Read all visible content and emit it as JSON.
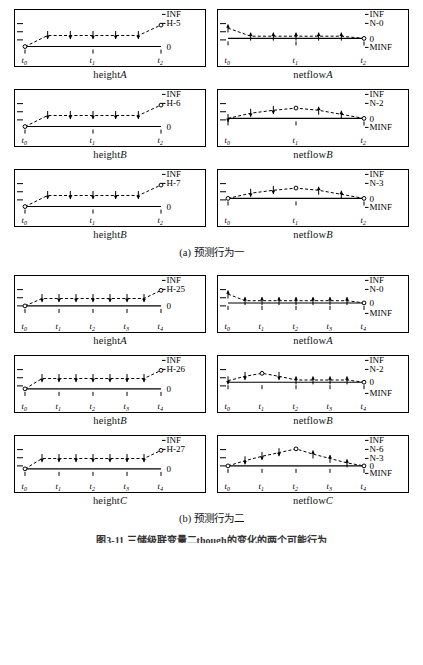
{
  "figure": {
    "caption_a": "(a) 预测行为一",
    "caption_b": "(b) 预测行为二",
    "caption_main": "图3-11  三储级联变量二though的变化的两个可能行为",
    "axis_labels": {
      "inf": "INF",
      "zero": "0",
      "minf": "MINF"
    }
  },
  "chart_data": {
    "type": "line",
    "panels": [
      {
        "id": "a-height-A",
        "caption": "heightA",
        "variable": "height",
        "object": "A",
        "group": "a",
        "value_labels": [
          "INF",
          "H-5",
          "0"
        ],
        "tick_labels": [
          "t0",
          "t1",
          "t2"
        ],
        "x": [
          0,
          1,
          2,
          3,
          4,
          5,
          6
        ],
        "y": [
          0.12,
          0.42,
          0.42,
          0.42,
          0.42,
          0.42,
          0.7
        ],
        "markers": [
          "circle",
          "up",
          "up",
          "up",
          "up",
          "up",
          "circle"
        ],
        "baseline": 0.12
      },
      {
        "id": "a-netflow-A",
        "caption": "netflowA",
        "variable": "netflow",
        "object": "A",
        "group": "a",
        "value_labels": [
          "INF",
          "N-0",
          "0",
          "MINF"
        ],
        "tick_labels": [
          "t0",
          "t1",
          "t2"
        ],
        "x": [
          0,
          1,
          2,
          3,
          4,
          5,
          6
        ],
        "y": [
          0.62,
          0.4,
          0.4,
          0.4,
          0.4,
          0.4,
          0.34
        ],
        "markers": [
          "down",
          "down",
          "down",
          "down",
          "down",
          "down",
          "circle"
        ],
        "baseline": 0.34
      },
      {
        "id": "a-height-B",
        "caption": "heightB",
        "variable": "height",
        "object": "B",
        "group": "a",
        "value_labels": [
          "INF",
          "H-6",
          "0"
        ],
        "tick_labels": [
          "t0",
          "t1",
          "t2"
        ],
        "x": [
          0,
          1,
          2,
          3,
          4,
          5,
          6
        ],
        "y": [
          0.12,
          0.42,
          0.42,
          0.42,
          0.42,
          0.42,
          0.7
        ],
        "markers": [
          "circle",
          "up",
          "up",
          "up",
          "up",
          "up",
          "circle"
        ],
        "baseline": 0.12
      },
      {
        "id": "a-netflow-B",
        "caption": "netflowB",
        "variable": "netflow",
        "object": "B",
        "group": "a",
        "value_labels": [
          "INF",
          "N-2",
          "0",
          "MINF"
        ],
        "tick_labels": [
          "t0",
          "t1",
          "t2"
        ],
        "x": [
          0,
          1,
          2,
          3,
          4,
          5,
          6
        ],
        "y": [
          0.34,
          0.48,
          0.56,
          0.62,
          0.56,
          0.45,
          0.34
        ],
        "markers": [
          "up",
          "up",
          "up",
          "circle",
          "down",
          "down",
          "circle"
        ],
        "baseline": 0.34
      },
      {
        "id": "a-height-B2",
        "caption": "heightB",
        "variable": "height",
        "object": "B",
        "group": "a",
        "value_labels": [
          "INF",
          "H-7",
          "0"
        ],
        "tick_labels": [
          "t0",
          "t1",
          "t2"
        ],
        "x": [
          0,
          1,
          2,
          3,
          4,
          5,
          6
        ],
        "y": [
          0.12,
          0.42,
          0.42,
          0.42,
          0.42,
          0.42,
          0.7
        ],
        "markers": [
          "circle",
          "up",
          "up",
          "up",
          "up",
          "up",
          "circle"
        ],
        "baseline": 0.12
      },
      {
        "id": "a-netflow-B2",
        "caption": "netflowB",
        "variable": "netflow",
        "object": "B",
        "group": "a",
        "value_labels": [
          "INF",
          "N-3",
          "0",
          "MINF"
        ],
        "tick_labels": [
          "t0",
          "t1",
          "t2"
        ],
        "x": [
          0,
          1,
          2,
          3,
          4,
          5,
          6
        ],
        "y": [
          0.34,
          0.48,
          0.56,
          0.62,
          0.56,
          0.45,
          0.34
        ],
        "markers": [
          "circle",
          "up",
          "up",
          "circle",
          "down",
          "down",
          "circle"
        ],
        "baseline": 0.34
      },
      {
        "id": "b-height-A",
        "caption": "heightA",
        "variable": "height",
        "object": "A",
        "group": "b",
        "value_labels": [
          "INF",
          "H-25",
          "0"
        ],
        "tick_labels": [
          "t0",
          "t1",
          "t2",
          "t3",
          "t4"
        ],
        "x": [
          0,
          1,
          2,
          3,
          4,
          5,
          6,
          7,
          8
        ],
        "y": [
          0.3,
          0.5,
          0.5,
          0.5,
          0.5,
          0.5,
          0.5,
          0.5,
          0.72
        ],
        "markers": [
          "circle",
          "up",
          "up",
          "up",
          "up",
          "up",
          "up",
          "up",
          "circle"
        ],
        "baseline": 0.3
      },
      {
        "id": "b-netflow-A",
        "caption": "netflowA",
        "variable": "netflow",
        "object": "A",
        "group": "b",
        "value_labels": [
          "INF",
          "N-0",
          "0",
          "MINF"
        ],
        "tick_labels": [
          "t0",
          "t1",
          "t2",
          "t3",
          "t4"
        ],
        "x": [
          0,
          1,
          2,
          3,
          4,
          5,
          6,
          7,
          8
        ],
        "y": [
          0.62,
          0.44,
          0.44,
          0.44,
          0.44,
          0.44,
          0.44,
          0.44,
          0.38
        ],
        "markers": [
          "down",
          "down",
          "down",
          "down",
          "down",
          "down",
          "down",
          "down",
          "circle"
        ],
        "baseline": 0.38
      },
      {
        "id": "b-height-B",
        "caption": "heightB",
        "variable": "height",
        "object": "B",
        "group": "b",
        "value_labels": [
          "INF",
          "H-26",
          "0"
        ],
        "tick_labels": [
          "t0",
          "t1",
          "t2",
          "t3",
          "t4"
        ],
        "x": [
          0,
          1,
          2,
          3,
          4,
          5,
          6,
          7,
          8
        ],
        "y": [
          0.22,
          0.5,
          0.5,
          0.5,
          0.5,
          0.5,
          0.5,
          0.5,
          0.72
        ],
        "markers": [
          "circle",
          "up",
          "up",
          "up",
          "up",
          "up",
          "up",
          "up",
          "circle"
        ],
        "baseline": 0.22
      },
      {
        "id": "b-netflow-B",
        "caption": "netflowB",
        "variable": "netflow",
        "object": "B",
        "group": "b",
        "value_labels": [
          "INF",
          "N-2",
          "0",
          "MINF"
        ],
        "tick_labels": [
          "t0",
          "t1",
          "t2",
          "t3",
          "t4"
        ],
        "x": [
          0,
          1,
          2,
          3,
          4,
          5,
          6,
          7,
          8
        ],
        "y": [
          0.44,
          0.56,
          0.64,
          0.56,
          0.46,
          0.46,
          0.46,
          0.46,
          0.4
        ],
        "markers": [
          "up",
          "up",
          "circle",
          "up",
          "down",
          "down",
          "down",
          "down",
          "circle"
        ],
        "baseline": 0.4
      },
      {
        "id": "b-height-C",
        "caption": "heightC",
        "variable": "height",
        "object": "C",
        "group": "b",
        "value_labels": [
          "INF",
          "H-27",
          "0"
        ],
        "tick_labels": [
          "t0",
          "t1",
          "t2",
          "t3",
          "t4"
        ],
        "x": [
          0,
          1,
          2,
          3,
          4,
          5,
          6,
          7,
          8
        ],
        "y": [
          0.22,
          0.5,
          0.5,
          0.5,
          0.5,
          0.5,
          0.5,
          0.5,
          0.72
        ],
        "markers": [
          "circle",
          "up",
          "up",
          "up",
          "up",
          "up",
          "up",
          "up",
          "circle"
        ],
        "baseline": 0.22
      },
      {
        "id": "b-netflow-C",
        "caption": "netflowC",
        "variable": "netflow",
        "object": "C",
        "group": "b",
        "value_labels": [
          "INF",
          "N-6",
          "N-3",
          "0",
          "MINF"
        ],
        "tick_labels": [
          "t0",
          "t1",
          "t2",
          "t3",
          "t4"
        ],
        "x": [
          0,
          1,
          2,
          3,
          4,
          5,
          6,
          7,
          8
        ],
        "y": [
          0.3,
          0.44,
          0.56,
          0.66,
          0.76,
          0.62,
          0.5,
          0.38,
          0.3
        ],
        "markers": [
          "circle",
          "up",
          "up",
          "up",
          "circle",
          "down",
          "down",
          "down",
          "circle"
        ],
        "baseline": 0.3
      }
    ]
  }
}
